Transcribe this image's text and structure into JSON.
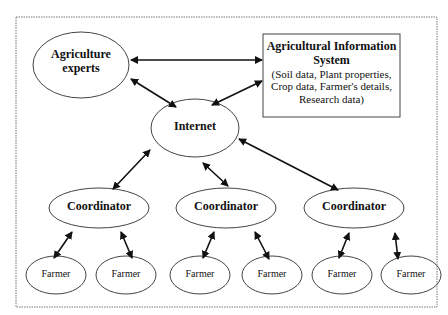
{
  "nodes": {
    "experts": {
      "label_line1": "Agriculture",
      "label_line2": "experts"
    },
    "ais": {
      "title_line1": "Agricultural Information",
      "title_line2": "System",
      "desc_line1": "(Soil data, Plant properties,",
      "desc_line2": "Crop data, Farmer's details,",
      "desc_line3": "Research data)"
    },
    "internet": {
      "label": "Internet"
    },
    "coordinators": [
      {
        "label": "Coordinator"
      },
      {
        "label": "Coordinator"
      },
      {
        "label": "Coordinator"
      }
    ],
    "farmers": [
      {
        "label": "Farmer"
      },
      {
        "label": "Farmer"
      },
      {
        "label": "Farmer"
      },
      {
        "label": "Farmer"
      },
      {
        "label": "Farmer"
      },
      {
        "label": "Farmer"
      }
    ]
  },
  "edges": [
    {
      "from": "experts",
      "to": "ais",
      "type": "bidirectional"
    },
    {
      "from": "experts",
      "to": "internet",
      "type": "bidirectional"
    },
    {
      "from": "ais",
      "to": "internet",
      "type": "bidirectional"
    },
    {
      "from": "internet",
      "to": "coordinator-1",
      "type": "bidirectional"
    },
    {
      "from": "internet",
      "to": "coordinator-2",
      "type": "bidirectional"
    },
    {
      "from": "internet",
      "to": "coordinator-3",
      "type": "bidirectional"
    },
    {
      "from": "coordinator-1",
      "to": "farmer-1",
      "type": "bidirectional"
    },
    {
      "from": "coordinator-1",
      "to": "farmer-2",
      "type": "bidirectional"
    },
    {
      "from": "coordinator-2",
      "to": "farmer-3",
      "type": "bidirectional"
    },
    {
      "from": "coordinator-2",
      "to": "farmer-4",
      "type": "bidirectional"
    },
    {
      "from": "coordinator-3",
      "to": "farmer-5",
      "type": "bidirectional"
    },
    {
      "from": "coordinator-3",
      "to": "farmer-6",
      "type": "bidirectional"
    }
  ]
}
